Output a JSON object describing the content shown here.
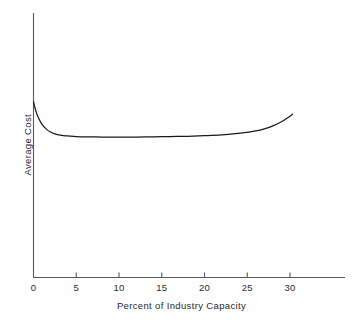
{
  "chart_data": {
    "type": "line",
    "title": "",
    "subtitle": "",
    "xlabel": "Percent of Industry Capacity",
    "ylabel": "Average Cost",
    "xlim": [
      0,
      35
    ],
    "ylim": [
      0,
      1
    ],
    "xticks": [
      0,
      5,
      10,
      15,
      20,
      25,
      30
    ],
    "xtick_labels": [
      "0",
      "5",
      "10",
      "15",
      "20",
      "25",
      "30"
    ],
    "yticks": [],
    "ytick_labels": [],
    "grid": false,
    "legend": null,
    "annotations": [],
    "axis_color": "#555555",
    "line_color": "#1a1a1a",
    "background_color": "#fefefe",
    "series": [
      {
        "name": "Average Cost",
        "x": [
          0.0,
          0.3,
          0.6,
          1.0,
          1.5,
          2.0,
          2.5,
          3.0,
          3.5,
          4.0,
          5.0,
          6.0,
          8.0,
          10.0,
          12.0,
          14.0,
          16.0,
          18.0,
          20.0,
          22.0,
          24.0,
          25.0,
          26.0,
          27.0,
          28.0,
          29.0,
          29.5,
          30.0,
          30.3
        ],
        "y": [
          0.664,
          0.627,
          0.602,
          0.579,
          0.561,
          0.55,
          0.543,
          0.539,
          0.536,
          0.535,
          0.533,
          0.532,
          0.531,
          0.531,
          0.531,
          0.532,
          0.533,
          0.534,
          0.536,
          0.539,
          0.545,
          0.549,
          0.554,
          0.562,
          0.573,
          0.589,
          0.599,
          0.61,
          0.618
        ]
      }
    ]
  },
  "axis": {
    "x_tick_labels": [
      "0",
      "5",
      "10",
      "15",
      "20",
      "25",
      "30"
    ],
    "x_axis_title": "Percent of Industry Capacity",
    "y_axis_title": "Average Cost"
  }
}
